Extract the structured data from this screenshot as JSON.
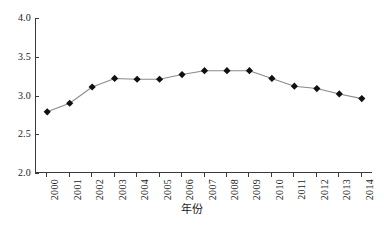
{
  "chart_data": {
    "type": "line",
    "title": "",
    "xlabel": "年份",
    "ylabel": "",
    "categories": [
      "2000",
      "2001",
      "2002",
      "2003",
      "2004",
      "2005",
      "2006",
      "2007",
      "2008",
      "2009",
      "2010",
      "2011",
      "2012",
      "2013",
      "2014"
    ],
    "values": [
      2.79,
      2.9,
      3.11,
      3.22,
      3.21,
      3.21,
      3.27,
      3.32,
      3.32,
      3.32,
      3.22,
      3.12,
      3.09,
      3.02,
      2.96
    ],
    "series": [
      {
        "name": "年份",
        "values": [
          2.79,
          2.9,
          3.11,
          3.22,
          3.21,
          3.21,
          3.27,
          3.32,
          3.32,
          3.32,
          3.22,
          3.12,
          3.09,
          3.02,
          2.96
        ]
      }
    ],
    "ylim": [
      2.0,
      4.0
    ],
    "ytick_labels": [
      "2.0",
      "2.5",
      "3.0",
      "3.5",
      "4.0"
    ],
    "ytick_values": [
      2.0,
      2.5,
      3.0,
      3.5,
      4.0
    ],
    "grid": false,
    "legend": "none",
    "marker": "diamond",
    "marker_color": "#101010",
    "line_color": "#8a8a8a",
    "axis_color": "#3a3a3a",
    "background": "#ffffff",
    "xtick_rotation": -90
  }
}
